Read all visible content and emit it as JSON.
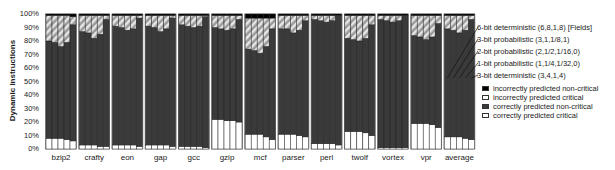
{
  "chart_data": {
    "type": "bar",
    "stacked": true,
    "title": "",
    "xlabel": "",
    "ylabel": "Dynamic Instructions",
    "ylim": [
      0,
      100
    ],
    "yticks": [
      "0%",
      "10%",
      "20%",
      "30%",
      "40%",
      "50%",
      "60%",
      "70%",
      "80%",
      "90%",
      "100%"
    ],
    "categories": [
      "bzip2",
      "crafty",
      "eon",
      "gap",
      "gcc",
      "gzip",
      "mcf",
      "parser",
      "perl",
      "twolf",
      "vortex",
      "vpr",
      "average"
    ],
    "configurations": [
      "6-bit deterministic (6,8,1,8) [Fields]",
      "3-bit probabilistic (3,1,1/8,1)",
      "2-bit probabilistic (2,1/2,1/16,0)",
      "1-bit probabilistic (1,1/4,1/32,0)",
      "3-bit deterministic (3,4,1,4)"
    ],
    "series": [
      {
        "name": "correctly predicted critical",
        "color": "#ffffff",
        "values": [
          [
            8,
            8,
            8,
            7,
            6
          ],
          [
            3,
            3,
            3,
            2,
            2
          ],
          [
            3,
            3,
            3,
            3,
            2
          ],
          [
            3,
            3,
            3,
            3,
            2
          ],
          [
            2,
            2,
            2,
            2,
            1
          ],
          [
            22,
            22,
            21,
            21,
            20
          ],
          [
            11,
            11,
            11,
            9,
            7
          ],
          [
            11,
            11,
            11,
            10,
            9
          ],
          [
            4,
            4,
            4,
            4,
            3
          ],
          [
            13,
            13,
            13,
            12,
            10
          ],
          [
            1,
            1,
            1,
            1,
            1
          ],
          [
            19,
            19,
            19,
            18,
            16
          ],
          [
            9,
            9,
            9,
            8,
            7
          ]
        ]
      },
      {
        "name": "correctly predicted non-critical",
        "color": "#3a3a3a",
        "values": [
          [
            72,
            71,
            68,
            72,
            86
          ],
          [
            84,
            83,
            79,
            83,
            94
          ],
          [
            88,
            87,
            85,
            86,
            95
          ],
          [
            88,
            87,
            84,
            86,
            95
          ],
          [
            90,
            89,
            88,
            89,
            97
          ],
          [
            68,
            67,
            67,
            68,
            76
          ],
          [
            63,
            62,
            60,
            67,
            82
          ],
          [
            78,
            78,
            75,
            78,
            86
          ],
          [
            92,
            91,
            90,
            91,
            96
          ],
          [
            69,
            68,
            67,
            70,
            82
          ],
          [
            95,
            94,
            93,
            94,
            98
          ],
          [
            65,
            64,
            62,
            65,
            77
          ],
          [
            80,
            79,
            77,
            80,
            89
          ]
        ]
      },
      {
        "name": "incorrectly predicted critical",
        "color": "#bdbdbd",
        "pattern": "hatched",
        "values": [
          [
            19,
            20,
            23,
            20,
            6
          ],
          [
            12,
            13,
            17,
            14,
            3
          ],
          [
            8,
            9,
            11,
            10,
            2
          ],
          [
            8,
            9,
            12,
            10,
            2
          ],
          [
            7,
            8,
            9,
            8,
            1
          ],
          [
            9,
            10,
            11,
            10,
            3
          ],
          [
            23,
            24,
            26,
            21,
            8
          ],
          [
            10,
            10,
            13,
            11,
            4
          ],
          [
            3,
            4,
            5,
            4,
            0
          ],
          [
            17,
            18,
            19,
            17,
            7
          ],
          [
            3,
            4,
            5,
            4,
            0
          ],
          [
            15,
            16,
            18,
            16,
            6
          ],
          [
            10,
            11,
            13,
            11,
            3
          ]
        ]
      },
      {
        "name": "incorrectly predicted non-critical",
        "color": "#000000",
        "values": [
          [
            1,
            1,
            1,
            1,
            2
          ],
          [
            1,
            1,
            1,
            1,
            1
          ],
          [
            1,
            1,
            1,
            1,
            1
          ],
          [
            1,
            1,
            1,
            1,
            1
          ],
          [
            1,
            1,
            1,
            1,
            1
          ],
          [
            1,
            1,
            1,
            1,
            1
          ],
          [
            3,
            3,
            3,
            3,
            3
          ],
          [
            1,
            1,
            1,
            1,
            1
          ],
          [
            1,
            1,
            1,
            1,
            1
          ],
          [
            1,
            1,
            1,
            1,
            1
          ],
          [
            1,
            1,
            1,
            1,
            1
          ],
          [
            1,
            1,
            1,
            1,
            1
          ],
          [
            1,
            1,
            1,
            1,
            1
          ]
        ]
      }
    ],
    "legend": {
      "series_labels": [
        "6-bit deterministic (6,8,1,8) [Fields]",
        "3-bit probabilistic (3,1,1/8,1)",
        "2-bit probabilistic (2,1/2,1/16,0)",
        "1-bit probabilistic (1,1/4,1/32,0)",
        "3-bit deterministic (3,4,1,4)"
      ],
      "category_labels": [
        "incorrectly predicted non-critical",
        "incorrectly predicted critical",
        "correctly predicted non-critical",
        "correctly predicted critical"
      ],
      "position": "right"
    },
    "grid": false
  }
}
